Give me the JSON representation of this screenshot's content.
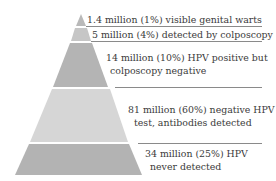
{
  "diagram": {
    "type": "pyramid",
    "layers": [
      {
        "label_line1": "1.4 million (1%) visible genital warts",
        "label_line2": "",
        "color": "#b9b9b9"
      },
      {
        "label_line1": "5 million (4%) detected by colposcopy",
        "label_line2": "",
        "color": "#c6c6c6"
      },
      {
        "label_line1": "14 million (10%) HPV positive but",
        "label_line2": "colposcopy negative",
        "color": "#b4b4b4"
      },
      {
        "label_line1": "81 million (60%) negative HPV",
        "label_line2": "test, antibodies detected",
        "color": "#d6d6d6"
      },
      {
        "label_line1": "34 million (25%) HPV",
        "label_line2": "never detected",
        "color": "#b3b3b3"
      }
    ],
    "divider_color": "#8a8a8a"
  }
}
